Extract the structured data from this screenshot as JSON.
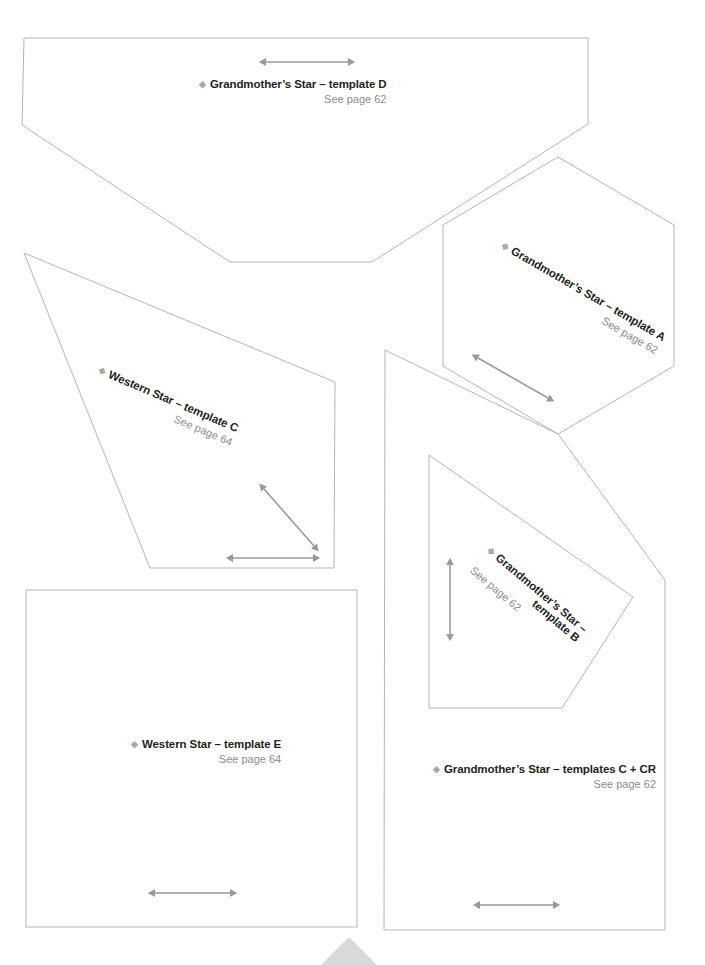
{
  "page": {
    "background_color": "#ffffff",
    "line_color": "#b5b5b5",
    "arrow_color": "#9a9a9a",
    "title_color": "#231f20",
    "subtitle_color": "#8c8c8c",
    "bullet_color": "#a8a8a8",
    "bullet_glyph": "◆",
    "corner_mark_color": "#d8d8d8"
  },
  "templates": [
    {
      "id": "grandmothers-star-template-d",
      "title": "Grandmother’s Star – template D",
      "subtitle": "See page 62",
      "rotation_deg": 0,
      "grain_arrow": "horizontal"
    },
    {
      "id": "grandmothers-star-template-a",
      "title": "Grandmother’s Star – template A",
      "subtitle": "See page 62",
      "rotation_deg": 30,
      "grain_arrow": "diagonal"
    },
    {
      "id": "western-star-template-c",
      "title": "Western Star – template C",
      "subtitle": "See page 64",
      "rotation_deg": 23,
      "grain_arrow": "diagonal-and-horizontal"
    },
    {
      "id": "grandmothers-star-template-b",
      "title_line1": "Grandmother’s Star –",
      "title_line2": "template B",
      "title": "Grandmother’s Star – template B",
      "subtitle": "See page 62",
      "rotation_deg": 40,
      "grain_arrow": "vertical"
    },
    {
      "id": "western-star-template-e",
      "title": "Western Star – template E",
      "subtitle": "See page 64",
      "rotation_deg": 0,
      "grain_arrow": "horizontal"
    },
    {
      "id": "grandmothers-star-templates-c-cr",
      "title": "Grandmother’s Star – templates C + CR",
      "subtitle": "See page 62",
      "rotation_deg": 0,
      "grain_arrow": "horizontal"
    }
  ],
  "page_marker": {
    "name": "page-bottom-triangle",
    "color": "#d9d9d9"
  }
}
